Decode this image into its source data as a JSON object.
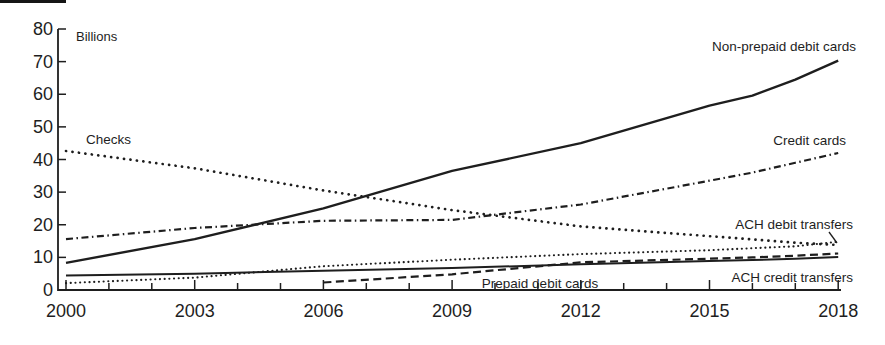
{
  "figure": {
    "background_color": "#ffffff",
    "ink_color": "#1e1e1e"
  },
  "chart_data": {
    "type": "line",
    "unit_label": "Billions",
    "xlim": [
      2000,
      2018
    ],
    "ylim": [
      0,
      80
    ],
    "y_ticks": [
      0,
      10,
      20,
      30,
      40,
      50,
      60,
      70,
      80
    ],
    "x_labeled_ticks": [
      2000,
      2003,
      2006,
      2009,
      2012,
      2015,
      2018
    ],
    "x_minor_tick_every_years": 1,
    "grid": false,
    "legend_position": "inline-labels",
    "series": [
      {
        "name": "non_prepaid_debit_cards",
        "label": "Non-prepaid debit cards",
        "line_style": "solid",
        "x": [
          2000,
          2003,
          2006,
          2009,
          2012,
          2015,
          2016,
          2017,
          2018
        ],
        "values": [
          8.3,
          15.6,
          25.0,
          36.5,
          45.0,
          56.5,
          59.6,
          64.5,
          70.3
        ]
      },
      {
        "name": "credit_cards",
        "label": "Credit cards",
        "line_style": "dash-dot",
        "x": [
          2000,
          2003,
          2006,
          2009,
          2012,
          2015,
          2016,
          2017,
          2018
        ],
        "values": [
          15.6,
          19.0,
          21.2,
          21.5,
          26.2,
          33.5,
          36.0,
          39.0,
          42.0
        ]
      },
      {
        "name": "checks",
        "label": "Checks",
        "line_style": "dotted-large",
        "x": [
          2000,
          2003,
          2006,
          2009,
          2012,
          2015,
          2016,
          2017,
          2018
        ],
        "values": [
          42.6,
          37.3,
          30.5,
          24.5,
          19.5,
          16.5,
          15.5,
          14.5,
          13.8
        ]
      },
      {
        "name": "ach_debit_transfers",
        "label": "ACH debit transfers",
        "line_style": "dotted-small",
        "x": [
          2000,
          2003,
          2006,
          2009,
          2012,
          2015,
          2016,
          2017,
          2018
        ],
        "values": [
          2.1,
          3.8,
          7.3,
          9.3,
          11.0,
          12.2,
          12.8,
          13.4,
          14.8
        ]
      },
      {
        "name": "prepaid_debit_cards",
        "label": "Prepaid debit cards",
        "line_style": "dashed",
        "x": [
          2006,
          2009,
          2012,
          2015,
          2016,
          2017,
          2018
        ],
        "values": [
          2.3,
          4.8,
          8.5,
          9.6,
          10.0,
          10.5,
          11.2
        ]
      },
      {
        "name": "ach_credit_transfers",
        "label": "ACH credit transfers",
        "line_style": "solid-thin",
        "x": [
          2000,
          2003,
          2006,
          2009,
          2012,
          2015,
          2016,
          2017,
          2018
        ],
        "values": [
          4.4,
          5.0,
          5.9,
          6.7,
          7.9,
          8.9,
          9.2,
          9.6,
          10.1
        ]
      }
    ]
  }
}
